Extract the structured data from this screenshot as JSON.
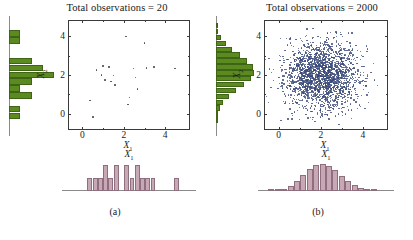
{
  "figure": {
    "panels": [
      {
        "id": "a",
        "caption": "(a)",
        "title": "Total observations = 20",
        "xlabel": "X",
        "xlabel_sub": "1",
        "ylabel": "X",
        "ylabel_sub": "2",
        "xticks": [
          "0",
          "2",
          "4"
        ],
        "yticks": [
          "0",
          "2",
          "4"
        ]
      },
      {
        "id": "b",
        "caption": "(b)",
        "title": "Total observations = 2000",
        "xlabel": "X",
        "xlabel_sub": "1",
        "ylabel": "X",
        "ylabel_sub": "2",
        "xticks": [
          "0",
          "2",
          "4"
        ],
        "yticks": [
          "0",
          "2",
          "4"
        ]
      }
    ]
  },
  "colors": {
    "marginal_x2_green": "#5a8a20",
    "marginal_x2_green_edge": "#3f6415",
    "marginal_x1_pink": "#c9a8b5",
    "marginal_x1_pink_edge": "#8f6f7e",
    "scatter_a_gray": "#4a4a4a",
    "scatter_b_blue": "#3b4a7a",
    "axis": "#3a3a3a",
    "background": "#ffffff"
  },
  "chart_data": [
    {
      "type": "scatter",
      "panel": "a",
      "title": "Total observations = 20",
      "xlabel": "X1",
      "ylabel": "X2",
      "n": 20,
      "xlim": [
        -0.7,
        5.1
      ],
      "ylim": [
        -0.75,
        4.85
      ],
      "grid": false,
      "legend": null,
      "x": [
        0.32,
        0.45,
        0.62,
        0.88,
        0.95,
        1.05,
        1.22,
        1.32,
        1.45,
        1.52,
        2.05,
        2.15,
        2.22,
        2.42,
        2.52,
        2.62,
        2.95,
        3.05,
        3.42,
        4.42
      ],
      "y": [
        0.72,
        -0.12,
        2.32,
        2.05,
        2.52,
        1.78,
        2.48,
        1.72,
        2.02,
        1.52,
        4.05,
        0.52,
        0.88,
        2.38,
        1.92,
        1.32,
        3.72,
        2.42,
        2.45,
        2.38
      ]
    },
    {
      "type": "bar",
      "panel": "a",
      "orientation": "horizontal",
      "variable": "X2",
      "description": "Marginal histogram of X2 (green, left of panel a)",
      "bin_centers": [
        4.15,
        3.8,
        3.45,
        3.1,
        2.75,
        2.4,
        2.05,
        1.7,
        1.35,
        1.0,
        0.65,
        0.3,
        -0.05
      ],
      "counts": [
        1,
        1,
        0,
        0,
        2,
        3,
        4,
        2,
        1,
        2,
        0,
        1,
        1
      ],
      "max_count": 4
    },
    {
      "type": "bar",
      "panel": "a",
      "orientation": "vertical",
      "variable": "X1",
      "description": "Marginal histogram of X1 (pink, below panel a)",
      "bin_centers": [
        0.35,
        0.6,
        0.85,
        1.1,
        1.35,
        1.6,
        1.85,
        2.1,
        2.35,
        2.6,
        2.85,
        3.1,
        3.35,
        3.85,
        4.45
      ],
      "counts": [
        1,
        1,
        1,
        2,
        1,
        2,
        0,
        2,
        1,
        2,
        1,
        1,
        1,
        0,
        1
      ],
      "max_count": 2
    },
    {
      "type": "scatter",
      "panel": "b",
      "title": "Total observations = 2000",
      "xlabel": "X1",
      "ylabel": "X2",
      "n": 2000,
      "xlim": [
        -0.7,
        5.1
      ],
      "ylim": [
        -0.75,
        4.85
      ],
      "grid": false,
      "legend": null,
      "distribution": "bivariate normal",
      "mean": [
        2.0,
        2.0
      ],
      "std": [
        0.85,
        0.85
      ],
      "correlation": 0.0
    },
    {
      "type": "bar",
      "panel": "b",
      "orientation": "horizontal",
      "variable": "X2",
      "description": "Marginal histogram of X2 (green, left of panel b), bell shaped",
      "bin_centers": [
        4.55,
        4.25,
        3.95,
        3.65,
        3.35,
        3.05,
        2.75,
        2.45,
        2.15,
        1.85,
        1.55,
        1.25,
        0.95,
        0.65,
        0.35,
        0.05,
        -0.25
      ],
      "counts": [
        4,
        12,
        30,
        62,
        105,
        155,
        205,
        240,
        248,
        228,
        185,
        132,
        88,
        48,
        24,
        10,
        3
      ],
      "max_count": 248
    },
    {
      "type": "bar",
      "panel": "b",
      "orientation": "vertical",
      "variable": "X1",
      "description": "Marginal histogram of X1 (pink, below panel b), bell shaped",
      "bin_centers": [
        -0.35,
        -0.05,
        0.25,
        0.55,
        0.85,
        1.15,
        1.45,
        1.75,
        2.05,
        2.35,
        2.65,
        2.95,
        3.25,
        3.55,
        3.85,
        4.15,
        4.45
      ],
      "counts": [
        3,
        9,
        22,
        48,
        92,
        148,
        200,
        238,
        250,
        232,
        190,
        140,
        95,
        55,
        28,
        12,
        5
      ],
      "max_count": 250
    }
  ]
}
